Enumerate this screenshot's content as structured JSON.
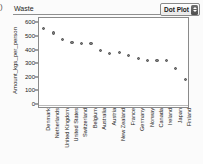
{
  "header": {
    "corner_glyph": ")",
    "panel_title": "Waste",
    "plot_type_label": "Dot Plot",
    "stepper_icon": "up-down-stepper-icon"
  },
  "chart_data": {
    "type": "scatter",
    "title": "Waste",
    "xlabel": "",
    "ylabel": "Amount_kgs_per_person",
    "ylim": [
      -30,
      640
    ],
    "yticks": [
      0,
      100,
      200,
      300,
      400,
      500,
      600
    ],
    "grid": false,
    "legend": null,
    "zero_reference_line": 0,
    "categories": [
      "Denmark",
      "Netherlands",
      "United Kingdom",
      "United States",
      "Switzerland",
      "Belgium",
      "Australia",
      "Austria",
      "New Zealand",
      "France",
      "Germany",
      "Norway",
      "Canada",
      "Ireland",
      "Japan",
      "Finland"
    ],
    "values": [
      560,
      530,
      480,
      460,
      450,
      450,
      400,
      380,
      383,
      362,
      340,
      330,
      330,
      330,
      270,
      190
    ]
  }
}
